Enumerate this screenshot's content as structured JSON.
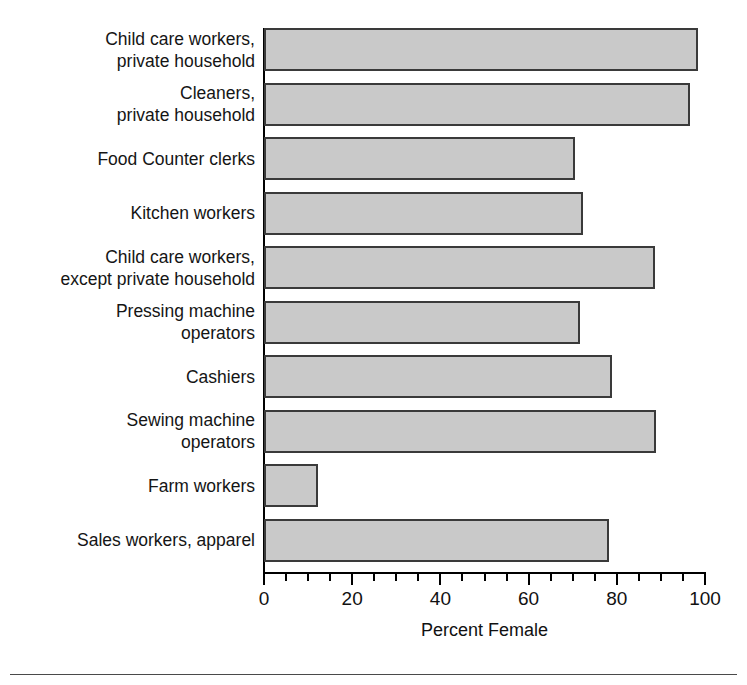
{
  "chart_data": {
    "type": "bar",
    "orientation": "horizontal",
    "title": "",
    "xlabel": "Percent Female",
    "ylabel": "",
    "xlim": [
      0,
      100
    ],
    "xticks": [
      0,
      20,
      40,
      60,
      80,
      100
    ],
    "xtick_labels": [
      "0",
      "20",
      "40",
      "60",
      "80",
      "100"
    ],
    "minor_tick_step": 5,
    "grid": false,
    "legend": false,
    "bar_fill_color": "#c9c9c9",
    "bar_edge_color": "#3a3a3a",
    "categories": [
      "Child care workers,\nprivate household",
      "Cleaners,\nprivate household",
      "Food Counter clerks",
      "Kitchen workers",
      "Child care workers,\nexcept private household",
      "Pressing machine\noperators",
      "Cashiers",
      "Sewing machine\noperators",
      "Farm workers",
      "Sales workers, apparel"
    ],
    "values": [
      98.4,
      96.6,
      70.5,
      72.3,
      88.6,
      71.6,
      79.0,
      89.0,
      12.2,
      78.2
    ]
  },
  "axis": {
    "x_title": "Percent Female"
  }
}
